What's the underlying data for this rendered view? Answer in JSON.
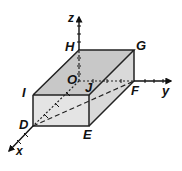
{
  "diagram": {
    "type": "3d-rectangular-prism",
    "colors": {
      "top_face": "#c8c8c8",
      "front_face": "#e4e4e4",
      "side_face": "#d9d9d9",
      "edge": "#222222"
    },
    "vertices": {
      "O": "O",
      "D": "D",
      "E": "E",
      "F": "F",
      "G": "G",
      "H": "H",
      "I": "I",
      "J": "J"
    },
    "axes": {
      "x": "x",
      "y": "y",
      "z": "z"
    }
  }
}
